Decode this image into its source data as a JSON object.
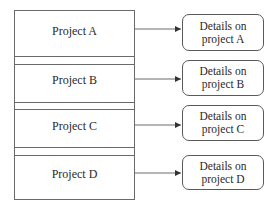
{
  "diagram": {
    "projects": [
      {
        "label": "Project A",
        "detail_line1": "Details on",
        "detail_line2": "project A"
      },
      {
        "label": "Project B",
        "detail_line1": "Details on",
        "detail_line2": "project B"
      },
      {
        "label": "Project C",
        "detail_line1": "Details on",
        "detail_line2": "project C"
      },
      {
        "label": "Project D",
        "detail_line1": "Details on",
        "detail_line2": "project D"
      }
    ],
    "colors": {
      "line": "#6a6a6a",
      "text": "#2a2a2a",
      "background": "#ffffff"
    }
  }
}
